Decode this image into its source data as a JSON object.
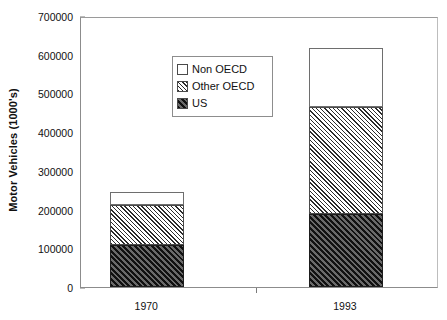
{
  "chart_data": {
    "type": "bar",
    "subtype": "stacked-bar",
    "title": "",
    "xlabel": "",
    "ylabel": "Motor Vehicles (1000's)",
    "categories": [
      "1970",
      "1993"
    ],
    "series": [
      {
        "name": "US",
        "values": [
          108000,
          189000
        ],
        "fill": "dark-diagonal-hatch"
      },
      {
        "name": "Other OECD",
        "values": [
          104000,
          276000
        ],
        "fill": "light-diagonal-hatch"
      },
      {
        "name": "Non OECD",
        "values": [
          33000,
          152000
        ],
        "fill": "white-empty"
      }
    ],
    "stack_totals": [
      245000,
      617000
    ],
    "ylim": [
      0,
      700000
    ],
    "yticks": [
      0,
      100000,
      200000,
      300000,
      400000,
      500000,
      600000,
      700000
    ],
    "ytick_labels": [
      "0",
      "100000",
      "200000",
      "300000",
      "400000",
      "500000",
      "600000",
      "700000"
    ],
    "grid": false,
    "legend_position": "inside-upper-center",
    "legend_entries": [
      "Non OECD",
      "Other OECD",
      "US"
    ],
    "colors": {
      "axis": "#8c8c8c",
      "text": "#111111",
      "us_fill": "#414141",
      "other_oecd_fill": "#ffffff",
      "non_oecd_fill": "#ffffff",
      "segment_border": "#4a4a4a"
    }
  },
  "legend": {
    "items": [
      {
        "label": "Non OECD",
        "swatch": "legend-swatch-non-oecd"
      },
      {
        "label": "Other OECD",
        "swatch": "legend-swatch-other-oecd"
      },
      {
        "label": "US",
        "swatch": "legend-swatch-us"
      }
    ]
  },
  "axes": {
    "y_title": "Motor Vehicles (1000's)",
    "y_labels": [
      "700000",
      "600000",
      "500000",
      "400000",
      "300000",
      "200000",
      "100000",
      "0"
    ],
    "x_labels": [
      "1970",
      "1993"
    ]
  }
}
